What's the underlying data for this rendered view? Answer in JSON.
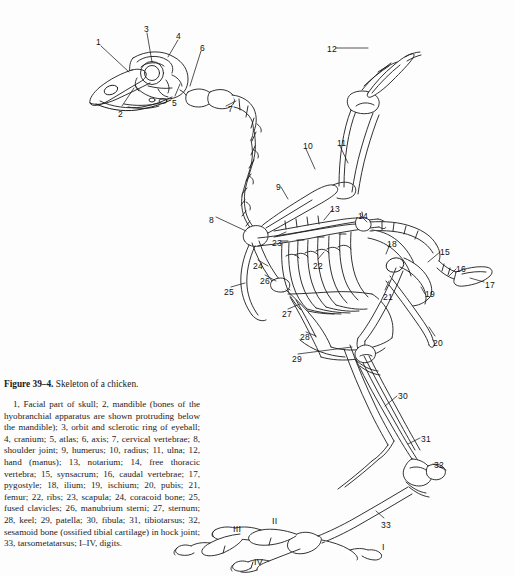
{
  "figure": {
    "number_label": "Figure 39–4.",
    "title": "Skeleton of a chicken.",
    "legend": "1, Facial part of skull; 2, mandible (bones of the hyobranchial apparatus are shown protruding below the mandible); 3, orbit and sclerotic ring of eyeball; 4, cranium; 5, atlas; 6, axis; 7, cervical vertebrae; 8, shoulder joint; 9, humerus; 10, radius; 11, ulna; 12, hand (manus); 13, notarium; 14, free thoracic vertebra; 15, synsacrum; 16, caudal vertebrae; 17, pygostyle; 18, ilium; 19, ischium; 20, pubis; 21, femur; 22, ribs; 23, scapula; 24, coracoid bone; 25, fused clavicles; 26, manubrium sterni; 27, sternum; 28, keel; 29, patella; 30, fibula; 31, tibiotarsus; 32, sesamoid bone (ossified tibial cartilage) in hock joint; 33, tarsometatarsus; I–IV, digits.",
    "page_header_artifact": "",
    "colors": {
      "background": "#fdfdfd",
      "ink": "#1a1a1a",
      "bone_outline": "#1b1b1b",
      "bone_fill": "#ffffff",
      "label_text": "#111111"
    }
  },
  "callouts": [
    {
      "id": "1",
      "text": "1",
      "x": 96,
      "y": 38,
      "term": "facial part of skull"
    },
    {
      "id": "2",
      "text": "2",
      "x": 118,
      "y": 110,
      "term": "mandible"
    },
    {
      "id": "3",
      "text": "3",
      "x": 144,
      "y": 25,
      "term": "orbit and sclerotic ring of eyeball"
    },
    {
      "id": "4",
      "text": "4",
      "x": 176,
      "y": 32,
      "term": "cranium"
    },
    {
      "id": "5",
      "text": "5",
      "x": 172,
      "y": 99,
      "term": "atlas"
    },
    {
      "id": "6",
      "text": "6",
      "x": 200,
      "y": 44,
      "term": "axis"
    },
    {
      "id": "7",
      "text": "7",
      "x": 228,
      "y": 105,
      "term": "cervical vertebrae"
    },
    {
      "id": "8",
      "text": "8",
      "x": 209,
      "y": 216,
      "term": "shoulder joint"
    },
    {
      "id": "9",
      "text": "9",
      "x": 276,
      "y": 183,
      "term": "humerus"
    },
    {
      "id": "10",
      "text": "10",
      "x": 303,
      "y": 142,
      "term": "radius"
    },
    {
      "id": "11",
      "text": "11",
      "x": 337,
      "y": 139,
      "term": "ulna"
    },
    {
      "id": "12",
      "text": "12",
      "x": 327,
      "y": 45,
      "term": "hand (manus)"
    },
    {
      "id": "13",
      "text": "13",
      "x": 330,
      "y": 205,
      "term": "notarium"
    },
    {
      "id": "14",
      "text": "14",
      "x": 358,
      "y": 212,
      "term": "free thoracic vertebra"
    },
    {
      "id": "15",
      "text": "15",
      "x": 440,
      "y": 248,
      "term": "synsacrum"
    },
    {
      "id": "16",
      "text": "16",
      "x": 456,
      "y": 265,
      "term": "caudal vertebrae"
    },
    {
      "id": "17",
      "text": "17",
      "x": 485,
      "y": 281,
      "term": "pygostyle"
    },
    {
      "id": "18",
      "text": "18",
      "x": 387,
      "y": 240,
      "term": "ilium"
    },
    {
      "id": "19",
      "text": "19",
      "x": 425,
      "y": 290,
      "term": "ischium"
    },
    {
      "id": "20",
      "text": "20",
      "x": 433,
      "y": 339,
      "term": "pubis"
    },
    {
      "id": "21",
      "text": "21",
      "x": 383,
      "y": 293,
      "term": "femur"
    },
    {
      "id": "22",
      "text": "22",
      "x": 313,
      "y": 262,
      "term": "ribs"
    },
    {
      "id": "23",
      "text": "23",
      "x": 272,
      "y": 239,
      "term": "scapula"
    },
    {
      "id": "24",
      "text": "24",
      "x": 253,
      "y": 262,
      "term": "coracoid bone"
    },
    {
      "id": "25",
      "text": "25",
      "x": 224,
      "y": 288,
      "term": "fused clavicles"
    },
    {
      "id": "26",
      "text": "26",
      "x": 260,
      "y": 277,
      "term": "manubrium sterni"
    },
    {
      "id": "27",
      "text": "27",
      "x": 282,
      "y": 310,
      "term": "sternum"
    },
    {
      "id": "28",
      "text": "28",
      "x": 300,
      "y": 333,
      "term": "keel"
    },
    {
      "id": "29",
      "text": "29",
      "x": 292,
      "y": 355,
      "term": "patella"
    },
    {
      "id": "30",
      "text": "30",
      "x": 398,
      "y": 392,
      "term": "fibula"
    },
    {
      "id": "31",
      "text": "31",
      "x": 421,
      "y": 435,
      "term": "tibiotarsus"
    },
    {
      "id": "32",
      "text": "32",
      "x": 434,
      "y": 461,
      "term": "sesamoid bone in hock joint"
    },
    {
      "id": "33",
      "text": "33",
      "x": 381,
      "y": 521,
      "term": "tarsometatarsus"
    },
    {
      "id": "I",
      "text": "I",
      "x": 382,
      "y": 543,
      "term": "digit I",
      "roman": true
    },
    {
      "id": "II",
      "text": "II",
      "x": 272,
      "y": 517,
      "term": "digit II",
      "roman": true
    },
    {
      "id": "III",
      "text": "III",
      "x": 233,
      "y": 525,
      "term": "digit III",
      "roman": true
    },
    {
      "id": "IV",
      "text": "IV",
      "x": 254,
      "y": 558,
      "term": "digit IV",
      "roman": true
    }
  ]
}
